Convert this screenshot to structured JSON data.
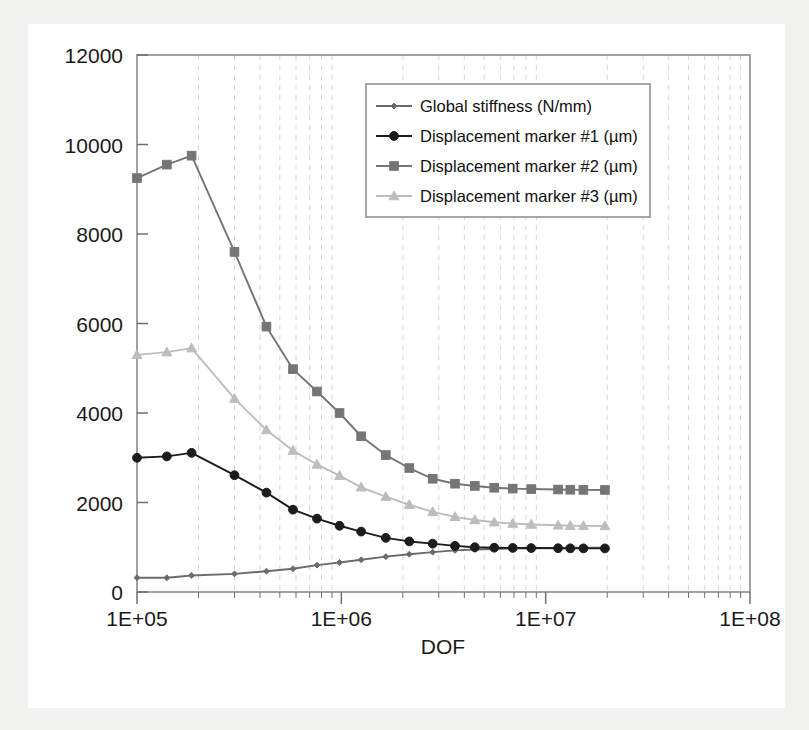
{
  "chart_data": {
    "type": "line",
    "title": "",
    "xlabel": "DOF",
    "ylabel": "",
    "xscale": "log",
    "xlim": [
      100000,
      100000000
    ],
    "ylim": [
      0,
      12000
    ],
    "grid": "vertical-minor-dashed",
    "legend_position": "top-center-right",
    "xtick_labels": [
      "1E+05",
      "1E+06",
      "1E+07",
      "1E+08"
    ],
    "xtick_values": [
      100000,
      1000000,
      10000000,
      100000000
    ],
    "ytick_labels": [
      "0",
      "2000",
      "4000",
      "6000",
      "8000",
      "10000",
      "12000"
    ],
    "ytick_values": [
      0,
      2000,
      4000,
      6000,
      8000,
      10000,
      12000
    ],
    "x": [
      100000,
      140000,
      185000,
      300000,
      430000,
      580000,
      760000,
      980000,
      1250000,
      1650000,
      2150000,
      2800000,
      3600000,
      4500000,
      5600000,
      6900000,
      8500000,
      11500000,
      13200000,
      15300000,
      19500000
    ],
    "series": [
      {
        "name": "Global stiffness (N/mm)",
        "marker": "diamond",
        "color": "#6b6b6b",
        "values": [
          320,
          318,
          370,
          405,
          465,
          520,
          600,
          660,
          720,
          790,
          845,
          890,
          930,
          950,
          962,
          972,
          978,
          985,
          988,
          990,
          992
        ]
      },
      {
        "name": "Displacement marker #1 (µm)",
        "marker": "circle",
        "color": "#1c1c1c",
        "values": [
          3000,
          3030,
          3110,
          2610,
          2220,
          1840,
          1640,
          1480,
          1350,
          1210,
          1130,
          1080,
          1030,
          1000,
          990,
          985,
          982,
          978,
          976,
          975,
          974
        ]
      },
      {
        "name": "Displacement marker #2 (µm)",
        "marker": "square",
        "color": "#757575",
        "values": [
          9250,
          9550,
          9750,
          7600,
          5930,
          4980,
          4480,
          4000,
          3480,
          3060,
          2770,
          2530,
          2420,
          2370,
          2330,
          2310,
          2300,
          2290,
          2285,
          2282,
          2280
        ]
      },
      {
        "name": "Displacement marker #3 (µm)",
        "marker": "triangle",
        "color": "#bdbdbd",
        "values": [
          5300,
          5360,
          5450,
          4320,
          3620,
          3160,
          2850,
          2600,
          2340,
          2130,
          1950,
          1790,
          1680,
          1610,
          1560,
          1530,
          1510,
          1490,
          1482,
          1478,
          1475
        ]
      }
    ]
  },
  "axis": {
    "x_title": "DOF"
  }
}
